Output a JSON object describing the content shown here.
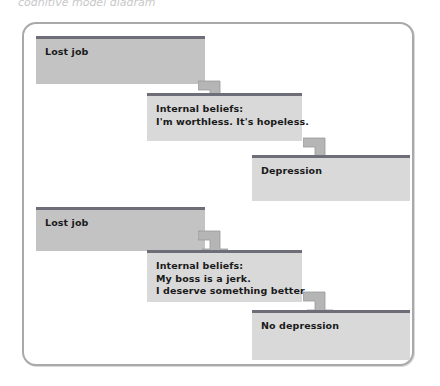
{
  "figure": {
    "top_text_sliver": "cognitive model diagram",
    "frame": {
      "border_color": "#a9a9a9",
      "background": "#ffffff"
    },
    "palette": {
      "box_dark_fill": "#c3c3c3",
      "box_light_fill": "#d9d9d9",
      "box_top_bar": "#6e6e78",
      "arrow_fill": "#b5b5b5",
      "arrow_stroke": "#8f8f8f",
      "text": "#1a1a1a"
    },
    "pathways": [
      {
        "name": "depression-pathway",
        "boxes": [
          {
            "id": "event-1",
            "lines": [
              "Lost job"
            ],
            "tone": "dark"
          },
          {
            "id": "beliefs-1",
            "lines": [
              "Internal beliefs:",
              "I'm worthless. It's hopeless."
            ],
            "tone": "light"
          },
          {
            "id": "outcome-1",
            "lines": [
              "Depression"
            ],
            "tone": "light"
          }
        ]
      },
      {
        "name": "no-depression-pathway",
        "boxes": [
          {
            "id": "event-2",
            "lines": [
              "Lost job"
            ],
            "tone": "dark"
          },
          {
            "id": "beliefs-2",
            "lines": [
              "Internal beliefs:",
              "My boss is a jerk.",
              "I deserve something better."
            ],
            "tone": "light"
          },
          {
            "id": "outcome-2",
            "lines": [
              "No depression"
            ],
            "tone": "light"
          }
        ]
      }
    ],
    "arrows": [
      {
        "id": "arrow-1",
        "from": "event-1",
        "to": "beliefs-1",
        "shape": "elbow-right-down"
      },
      {
        "id": "arrow-2",
        "from": "beliefs-1",
        "to": "outcome-1",
        "shape": "elbow-right-down"
      },
      {
        "id": "arrow-3",
        "from": "event-2",
        "to": "beliefs-2",
        "shape": "elbow-right-down"
      },
      {
        "id": "arrow-4",
        "from": "beliefs-2",
        "to": "outcome-2",
        "shape": "elbow-right-down"
      }
    ]
  }
}
